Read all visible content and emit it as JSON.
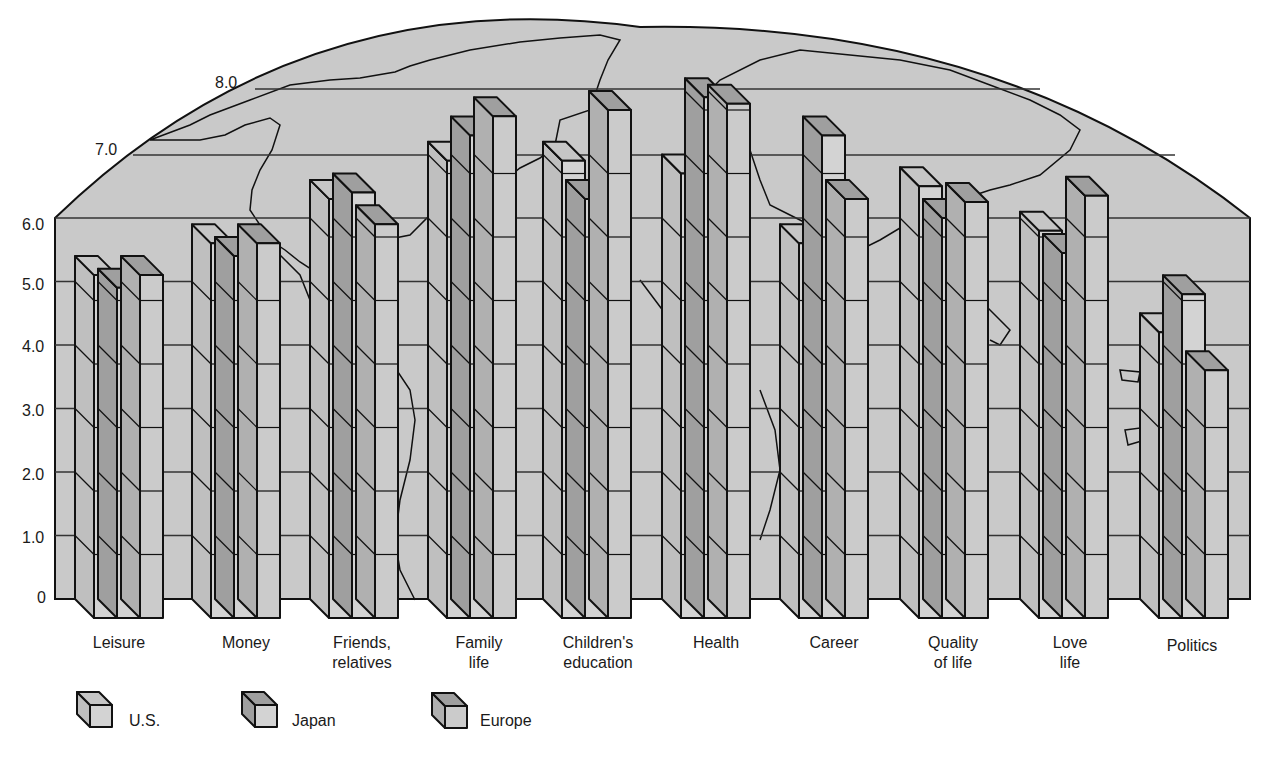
{
  "chart_data": {
    "type": "bar",
    "style": "3d-grouped-bar-over-world-map",
    "title": "",
    "xlabel": "",
    "ylabel": "",
    "ylim": [
      0,
      8.5
    ],
    "yticks": [
      "0",
      "1.0",
      "2.0",
      "3.0",
      "4.0",
      "5.0",
      "6.0",
      "7.0",
      "8.0"
    ],
    "grid": true,
    "legend_position": "bottom-left",
    "categories": [
      "Leisure",
      "Money",
      "Friends,\nrelatives",
      "Family\nlife",
      "Children's\neducation",
      "Health",
      "Career",
      "Quality\nof life",
      "Love\nlife",
      "Politics"
    ],
    "series": [
      {
        "name": "U.S.",
        "values": [
          5.4,
          5.9,
          6.6,
          7.2,
          7.2,
          7.0,
          5.9,
          6.8,
          6.1,
          4.5
        ]
      },
      {
        "name": "Japan",
        "values": [
          5.2,
          5.7,
          6.7,
          7.6,
          6.6,
          8.2,
          7.6,
          6.3,
          5.75,
          5.1
        ]
      },
      {
        "name": "Europe",
        "values": [
          5.4,
          5.9,
          6.2,
          7.9,
          8.0,
          8.1,
          6.6,
          6.55,
          6.65,
          3.9
        ]
      }
    ]
  },
  "axis": {
    "y_ticks": [
      "0",
      "1.0",
      "2.0",
      "3.0",
      "4.0",
      "5.0",
      "6.0",
      "7.0",
      "8.0"
    ]
  },
  "labels": [
    {
      "line1": "Leisure",
      "line2": ""
    },
    {
      "line1": "Money",
      "line2": ""
    },
    {
      "line1": "Friends,",
      "line2": "relatives"
    },
    {
      "line1": "Family",
      "line2": "life"
    },
    {
      "line1": "Children's",
      "line2": "education"
    },
    {
      "line1": "Health",
      "line2": ""
    },
    {
      "line1": "Career",
      "line2": ""
    },
    {
      "line1": "Quality",
      "line2": "of life"
    },
    {
      "line1": "Love",
      "line2": "life"
    },
    {
      "line1": "Politics",
      "line2": ""
    }
  ],
  "legend": {
    "us": "U.S.",
    "japan": "Japan",
    "europe": "Europe"
  },
  "colors": {
    "map_fill": "#c9c9c9",
    "front_light": "#d3d3d3",
    "side_light": "#bfbfbf",
    "top_light": "#c6c6c6",
    "dark": "#9f9f9f",
    "mid": "#b0b0b0",
    "line": "#111111"
  }
}
